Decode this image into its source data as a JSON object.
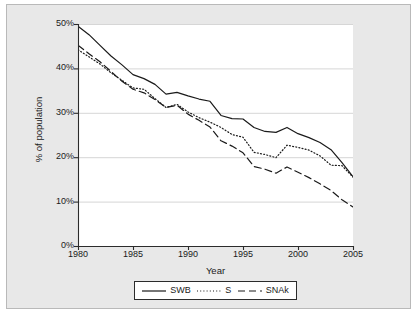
{
  "chart_data": {
    "type": "line",
    "title": "",
    "xlabel": "Year",
    "ylabel": "% of population",
    "xlim": [
      1980,
      2005
    ],
    "ylim": [
      0,
      50
    ],
    "grid": "horizontal",
    "legend_position": "bottom",
    "x_ticks": [
      "1980",
      "1985",
      "1990",
      "1995",
      "2000",
      "2005"
    ],
    "x_tick_values": [
      1980,
      1985,
      1990,
      1995,
      2000,
      2005
    ],
    "y_ticks": [
      "0%",
      "10%",
      "20%",
      "30%",
      "40%",
      "50%"
    ],
    "y_tick_values": [
      0,
      10,
      20,
      30,
      40,
      50
    ],
    "x": [
      1980,
      1981,
      1982,
      1983,
      1984,
      1985,
      1986,
      1987,
      1988,
      1989,
      1990,
      1991,
      1992,
      1993,
      1994,
      1995,
      1996,
      1997,
      1998,
      1999,
      2000,
      2001,
      2002,
      2003,
      2004,
      2005
    ],
    "series": [
      {
        "name": "SWB",
        "style": "solid",
        "color": "#1a1a1a",
        "values": [
          49.5,
          47.6,
          45.2,
          42.8,
          40.8,
          38.6,
          37.7,
          36.4,
          34.2,
          34.6,
          33.8,
          33.1,
          32.6,
          29.4,
          28.7,
          28.6,
          26.7,
          25.8,
          25.6,
          26.7,
          25.3,
          24.4,
          23.3,
          21.7,
          18.8,
          15.6
        ]
      },
      {
        "name": "S",
        "style": "dotted",
        "color": "#1a1a1a",
        "values": [
          44.2,
          42.6,
          41.0,
          39.0,
          37.3,
          35.6,
          35.3,
          33.2,
          31.2,
          31.9,
          30.2,
          28.9,
          27.9,
          26.7,
          25.1,
          24.5,
          21.1,
          20.6,
          19.9,
          22.7,
          22.2,
          21.6,
          20.3,
          18.2,
          18.1,
          15.5
        ]
      },
      {
        "name": "SNAk",
        "style": "dashed",
        "color": "#1a1a1a",
        "values": [
          45.2,
          43.3,
          41.5,
          39.3,
          37.1,
          35.3,
          34.5,
          33.0,
          31.2,
          31.7,
          29.7,
          28.3,
          26.8,
          23.7,
          22.5,
          21.0,
          17.9,
          17.3,
          16.4,
          17.8,
          16.6,
          15.4,
          14.0,
          12.5,
          10.4,
          8.8
        ]
      }
    ]
  },
  "axes": {
    "xlabel": "Year",
    "ylabel": "% of population"
  },
  "legend": {
    "entries": [
      {
        "label": "SWB",
        "style": "solid"
      },
      {
        "label": "S",
        "style": "dotted"
      },
      {
        "label": "SNAk",
        "style": "dashed"
      }
    ]
  }
}
